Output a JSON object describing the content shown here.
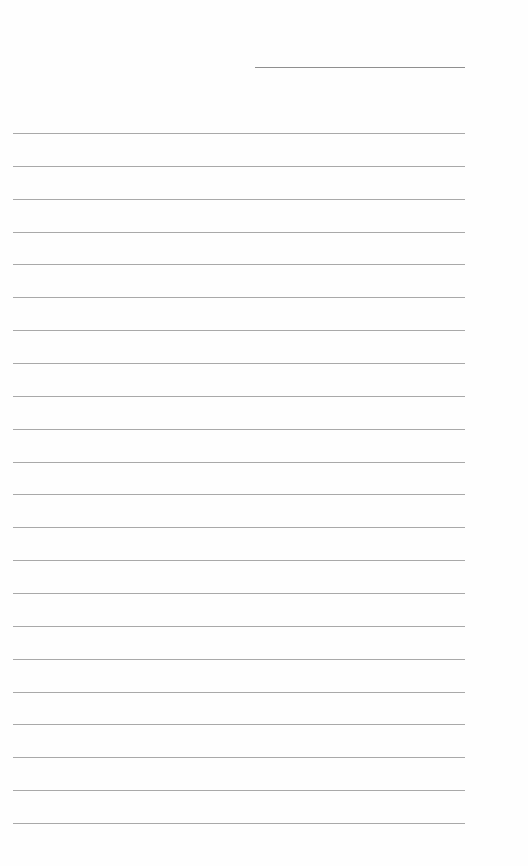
{
  "page": {
    "type": "lined-paper",
    "background_color": "#fefefe",
    "line_color": "#9a9a9a",
    "header": {
      "line_label": "",
      "line_x": 255,
      "line_y": 67,
      "line_width": 210
    },
    "body_lines": {
      "count": 22,
      "start_y": 133,
      "spacing": 32.86,
      "left_x": 13,
      "right_x": 465
    }
  }
}
